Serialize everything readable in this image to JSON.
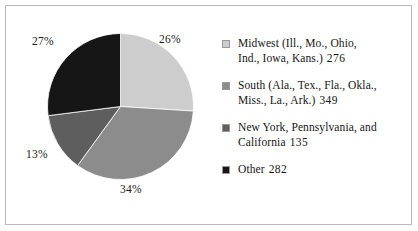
{
  "chart_data": {
    "type": "pie",
    "title": "",
    "subtitle": "",
    "xlabel": "",
    "ylabel": "",
    "legend_position": "right",
    "grid": false,
    "start_angle_clock": "12 o'clock",
    "direction": "clockwise",
    "categories": [
      "Midwest (Ill., Mo., Ohio, Ind., Iowa, Kans.)",
      "South (Ala., Tex., Fla., Okla., Miss., La., Ark.)",
      "New York, Pennsylvania, and California",
      "Other"
    ],
    "values": [
      276,
      349,
      135,
      282
    ],
    "percentages": [
      26,
      34,
      13,
      27
    ],
    "percent_labels": [
      "26%",
      "34%",
      "13%",
      "27%"
    ],
    "colors": [
      "#cdcdcd",
      "#8c8c8c",
      "#5e5e5e",
      "#161616"
    ],
    "total": 1042
  },
  "legend": {
    "items": [
      {
        "line1": "Midwest (Ill., Mo., Ohio,",
        "line2": "Ind., Iowa, Kans.)",
        "count": "276",
        "color": "#cdcdcd"
      },
      {
        "line1": "South (Ala., Tex., Fla., Okla.,",
        "line2": "Miss., La., Ark.)",
        "count": "349",
        "color": "#8c8c8c"
      },
      {
        "line1": "New York, Pennsylvania, and",
        "line2": "California",
        "count": "135",
        "color": "#5e5e5e"
      },
      {
        "line1": "Other",
        "line2": "",
        "count": "282",
        "color": "#161616"
      }
    ]
  },
  "style": {
    "background": "#ffffff",
    "frame_color": "#b9b9b9",
    "text_color": "#161616",
    "wedge_outline": "#ffffff"
  }
}
